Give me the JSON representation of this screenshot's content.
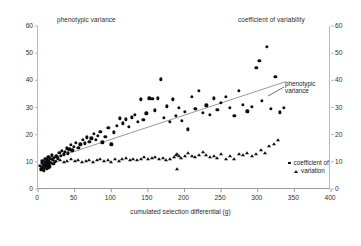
{
  "chart_data": {
    "type": "scatter",
    "title": "",
    "xlabel": "cumulated selection differential (g)",
    "ylabel_left": "phenotypic variance",
    "ylabel_right": "coefficient of variability",
    "xlim": [
      0,
      400
    ],
    "ylim_left": [
      0,
      60
    ],
    "ylim_right": [
      0,
      60
    ],
    "xticks": [
      0,
      50,
      100,
      150,
      200,
      250,
      300,
      350,
      400
    ],
    "yticks_left": [
      0,
      10,
      20,
      30,
      40,
      50,
      60
    ],
    "yticks_right": [
      0,
      10,
      20,
      30,
      40,
      50,
      60
    ],
    "grid": false,
    "legend_position": "right-inside",
    "marker_color": "#0d0d0d",
    "trendline_color": "#8c8c8c",
    "annotations": [
      {
        "text_line1": "phenotypic",
        "text_line2": "variance",
        "x": 300,
        "y": 40
      },
      {
        "text_line1": "coefficient of",
        "text_line2": "variation",
        "x": 300,
        "y": 13
      }
    ],
    "trendline": {
      "x1": 18,
      "y1": 11.0,
      "x2": 338,
      "y2": 39.5
    },
    "series": [
      {
        "name": "phenotypic variance",
        "marker": "circle",
        "axis": "left",
        "points": [
          [
            3,
            8.4
          ],
          [
            4,
            7.2
          ],
          [
            5,
            9.6
          ],
          [
            5,
            7.0
          ],
          [
            6,
            8.0
          ],
          [
            6,
            10.4
          ],
          [
            7,
            7.6
          ],
          [
            7,
            9.2
          ],
          [
            8,
            8.8
          ],
          [
            8,
            6.9
          ],
          [
            9,
            10.0
          ],
          [
            9,
            7.8
          ],
          [
            10,
            9.0
          ],
          [
            10,
            11.2
          ],
          [
            11,
            8.2
          ],
          [
            11,
            9.8
          ],
          [
            12,
            7.4
          ],
          [
            12,
            10.6
          ],
          [
            13,
            9.4
          ],
          [
            13,
            8.6
          ],
          [
            14,
            11.6
          ],
          [
            14,
            7.9
          ],
          [
            15,
            9.1
          ],
          [
            15,
            10.2
          ],
          [
            16,
            8.3
          ],
          [
            17,
            11.0
          ],
          [
            18,
            9.7
          ],
          [
            19,
            12.4
          ],
          [
            20,
            10.8
          ],
          [
            21,
            9.3
          ],
          [
            22,
            11.4
          ],
          [
            23,
            10.1
          ],
          [
            25,
            12.0
          ],
          [
            27,
            11.3
          ],
          [
            29,
            13.2
          ],
          [
            31,
            12.1
          ],
          [
            33,
            14.0
          ],
          [
            35,
            12.8
          ],
          [
            37,
            13.6
          ],
          [
            39,
            15.0
          ],
          [
            41,
            13.1
          ],
          [
            43,
            14.6
          ],
          [
            45,
            16.2
          ],
          [
            47,
            14.2
          ],
          [
            49,
            15.4
          ],
          [
            52,
            17.0
          ],
          [
            55,
            15.1
          ],
          [
            58,
            16.4
          ],
          [
            61,
            18.2
          ],
          [
            64,
            16.8
          ],
          [
            67,
            19.0
          ],
          [
            70,
            17.4
          ],
          [
            73,
            18.6
          ],
          [
            76,
            20.2
          ],
          [
            79,
            18.0
          ],
          [
            82,
            19.6
          ],
          [
            85,
            21.0
          ],
          [
            88,
            17.2
          ],
          [
            92,
            19.2
          ],
          [
            96,
            22.4
          ],
          [
            100,
            16.4
          ],
          [
            104,
            20.8
          ],
          [
            108,
            23.2
          ],
          [
            112,
            26.0
          ],
          [
            116,
            24.2
          ],
          [
            120,
            25.6
          ],
          [
            124,
            23.0
          ],
          [
            128,
            26.4
          ],
          [
            132,
            27.2
          ],
          [
            136,
            24.8
          ],
          [
            140,
            33.0
          ],
          [
            144,
            25.4
          ],
          [
            148,
            27.8
          ],
          [
            152,
            33.4
          ],
          [
            156,
            33.2
          ],
          [
            160,
            29.0
          ],
          [
            164,
            33.4
          ],
          [
            168,
            40.4
          ],
          [
            172,
            26.2
          ],
          [
            176,
            30.4
          ],
          [
            180,
            24.6
          ],
          [
            184,
            33.0
          ],
          [
            188,
            27.0
          ],
          [
            192,
            30.0
          ],
          [
            196,
            25.2
          ],
          [
            200,
            28.4
          ],
          [
            205,
            22.0
          ],
          [
            210,
            34.0
          ],
          [
            215,
            29.6
          ],
          [
            220,
            36.0
          ],
          [
            225,
            28.0
          ],
          [
            230,
            30.8
          ],
          [
            235,
            27.4
          ],
          [
            240,
            33.4
          ],
          [
            245,
            29.2
          ],
          [
            250,
            31.6
          ],
          [
            256,
            33.8
          ],
          [
            262,
            29.8
          ],
          [
            268,
            26.8
          ],
          [
            274,
            36.2
          ],
          [
            280,
            31.0
          ],
          [
            286,
            28.6
          ],
          [
            292,
            30.2
          ],
          [
            298,
            44.6
          ],
          [
            302,
            47.2
          ],
          [
            306,
            32.4
          ],
          [
            312,
            52.2
          ],
          [
            318,
            29.4
          ],
          [
            324,
            41.4
          ],
          [
            330,
            28.2
          ],
          [
            336,
            30.0
          ]
        ]
      },
      {
        "name": "coefficient of variation",
        "marker": "triangle",
        "axis": "right",
        "points": [
          [
            20,
            10.6
          ],
          [
            25,
            10.2
          ],
          [
            30,
            10.8
          ],
          [
            35,
            10.0
          ],
          [
            40,
            10.4
          ],
          [
            45,
            11.0
          ],
          [
            50,
            10.2
          ],
          [
            55,
            10.6
          ],
          [
            60,
            10.0
          ],
          [
            65,
            10.4
          ],
          [
            70,
            10.8
          ],
          [
            75,
            10.1
          ],
          [
            80,
            10.5
          ],
          [
            85,
            10.9
          ],
          [
            90,
            10.2
          ],
          [
            95,
            10.6
          ],
          [
            100,
            10.0
          ],
          [
            105,
            11.2
          ],
          [
            110,
            10.4
          ],
          [
            115,
            11.0
          ],
          [
            120,
            11.4
          ],
          [
            125,
            10.8
          ],
          [
            130,
            11.2
          ],
          [
            135,
            10.6
          ],
          [
            140,
            11.0
          ],
          [
            145,
            11.6
          ],
          [
            150,
            10.9
          ],
          [
            155,
            11.3
          ],
          [
            160,
            11.8
          ],
          [
            165,
            11.1
          ],
          [
            170,
            11.5
          ],
          [
            175,
            10.7
          ],
          [
            180,
            11.2
          ],
          [
            185,
            11.9
          ],
          [
            188,
            12.6
          ],
          [
            190,
            13.0
          ],
          [
            190,
            7.2
          ],
          [
            192,
            12.2
          ],
          [
            195,
            11.4
          ],
          [
            200,
            12.0
          ],
          [
            205,
            13.4
          ],
          [
            210,
            12.2
          ],
          [
            215,
            11.8
          ],
          [
            220,
            12.6
          ],
          [
            225,
            13.8
          ],
          [
            230,
            12.4
          ],
          [
            235,
            11.6
          ],
          [
            240,
            12.0
          ],
          [
            245,
            11.4
          ],
          [
            250,
            12.8
          ],
          [
            256,
            11.0
          ],
          [
            262,
            12.2
          ],
          [
            268,
            11.2
          ],
          [
            274,
            13.0
          ],
          [
            280,
            12.4
          ],
          [
            286,
            13.4
          ],
          [
            292,
            12.0
          ],
          [
            298,
            12.8
          ],
          [
            304,
            14.2
          ],
          [
            310,
            13.2
          ],
          [
            316,
            15.8
          ],
          [
            322,
            16.4
          ],
          [
            328,
            18.2
          ]
        ]
      }
    ]
  },
  "axes": {
    "x_ticks": [
      "0",
      "50",
      "100",
      "150",
      "200",
      "250",
      "300",
      "350",
      "400"
    ],
    "y_left_ticks": [
      "60",
      "50",
      "40",
      "30",
      "20",
      "10",
      "0"
    ],
    "y_right_ticks": [
      "60",
      "50",
      "40",
      "30",
      "20",
      "10",
      "0"
    ],
    "x_axis_label": "cumulated selection differential (g)",
    "left_axis_title": "phenotypic variance",
    "right_axis_title": "coefficient of variability"
  },
  "annotation": {
    "phenotypic_line1": "phenotypic",
    "phenotypic_line2": "variance"
  },
  "legend": {
    "line1": "coefficient of",
    "line2": "variation"
  }
}
